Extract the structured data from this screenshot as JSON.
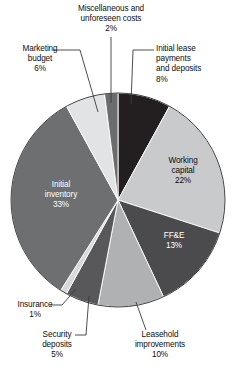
{
  "chart_data": {
    "type": "pie",
    "title": "",
    "subtitle": "",
    "xlabel": "",
    "ylabel": "",
    "legend_position": "none",
    "grid": false,
    "units": "percent",
    "total": 100,
    "start_angle_deg": 0,
    "direction": "clockwise",
    "categories": [
      "Initial lease payments and deposits",
      "Working capital",
      "FF&E",
      "Leasehold improvements",
      "Security deposits",
      "Insurance",
      "Initial inventory",
      "Marketing budget",
      "Miscellaneous and unforeseen costs"
    ],
    "values": [
      8,
      22,
      13,
      10,
      5,
      1,
      33,
      6,
      2
    ],
    "value_labels": [
      "8%",
      "22%",
      "13%",
      "10%",
      "5%",
      "1%",
      "33%",
      "6%",
      "2%"
    ],
    "colors": [
      "#231f20",
      "#c9cacb",
      "#4b4b4d",
      "#b0b1b2",
      "#58585a",
      "#d8d9da",
      "#6e6f71",
      "#e2e3e4",
      "#6b6c6e"
    ],
    "slices": [
      {
        "label": "Initial lease payments and deposits",
        "value": 8,
        "value_label": "8%",
        "color": "#231f20",
        "label_placement": "callout",
        "label_text_color": "#0d0d0d"
      },
      {
        "label": "Working capital",
        "value": 22,
        "value_label": "22%",
        "color": "#c9cacb",
        "label_placement": "inside",
        "label_text_color": "#0d0d0d"
      },
      {
        "label": "FF&E",
        "value": 13,
        "value_label": "13%",
        "color": "#4b4b4d",
        "label_placement": "inside",
        "label_text_color": "#ffffff"
      },
      {
        "label": "Leasehold improvements",
        "value": 10,
        "value_label": "10%",
        "color": "#b0b1b2",
        "label_placement": "callout",
        "label_text_color": "#0d0d0d"
      },
      {
        "label": "Security deposits",
        "value": 5,
        "value_label": "5%",
        "color": "#58585a",
        "label_placement": "callout",
        "label_text_color": "#0d0d0d"
      },
      {
        "label": "Insurance",
        "value": 1,
        "value_label": "1%",
        "color": "#d8d9da",
        "label_placement": "callout",
        "label_text_color": "#0d0d0d"
      },
      {
        "label": "Initial inventory",
        "value": 33,
        "value_label": "33%",
        "color": "#6e6f71",
        "label_placement": "inside",
        "label_text_color": "#ffffff"
      },
      {
        "label": "Marketing budget",
        "value": 6,
        "value_label": "6%",
        "color": "#e2e3e4",
        "label_placement": "callout",
        "label_text_color": "#0d0d0d"
      },
      {
        "label": "Miscellaneous and unforeseen costs",
        "value": 2,
        "value_label": "2%",
        "color": "#6b6c6e",
        "label_placement": "callout",
        "label_text_color": "#0d0d0d"
      }
    ]
  },
  "labels": {
    "misc": {
      "line1": "Miscellaneous and",
      "line2": "unforeseen costs",
      "line3": "2%"
    },
    "marketing": {
      "line1": "Marketing",
      "line2": "budget",
      "line3": "6%"
    },
    "lease": {
      "line1": "Initial lease",
      "line2": "payments",
      "line3": "and deposits",
      "line4": "8%"
    },
    "working": {
      "line1": "Working",
      "line2": "capital",
      "line3": "22%"
    },
    "ffe": {
      "line1": "FF&E",
      "line2": "13%"
    },
    "inventory": {
      "line1": "Initial",
      "line2": "inventory",
      "line3": "33%"
    },
    "leasehold": {
      "line1": "Leasehold",
      "line2": "improvements",
      "line3": "10%"
    },
    "security": {
      "line1": "Security",
      "line2": "deposits",
      "line3": "5%"
    },
    "insurance": {
      "line1": "Insurance",
      "line2": "1%"
    }
  },
  "style": {
    "background": "#ffffff",
    "leader_line_color": "#3a3a3a",
    "slice_edge_color": "#ffffff"
  }
}
